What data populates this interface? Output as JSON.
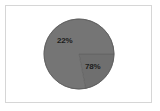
{
  "figure": {
    "background_color": "#ffffff",
    "frame_color": "#d6d6d6",
    "alt_title": ""
  },
  "chart_data": {
    "type": "pie",
    "title": "",
    "subtitle": "",
    "xlabel": "",
    "ylabel": "",
    "grid": false,
    "legend": false,
    "legend_position": "none",
    "labels_inside": true,
    "start_angle_deg": 0,
    "direction": "clockwise",
    "categories": [
      "22%",
      "78%"
    ],
    "values": [
      22,
      78
    ],
    "value_labels": [
      "22%",
      "78%"
    ],
    "colors": [
      "#6f6f6f",
      "#757575"
    ],
    "edge_color": "#5c5c5c",
    "label_text_color": "#1c1c1c",
    "slices": [
      {
        "name": "slice-22",
        "label": "22%",
        "value": 22,
        "color": "#6f6f6f"
      },
      {
        "name": "slice-78",
        "label": "78%",
        "value": 78,
        "color": "#757575"
      }
    ],
    "geometry": {
      "center_x": 79,
      "center_y": 54,
      "radius": 35
    }
  }
}
